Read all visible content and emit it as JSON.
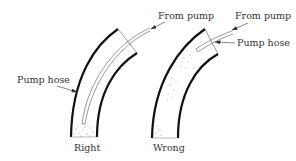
{
  "figure": {
    "panels": [
      {
        "id": "right",
        "caption": "Right",
        "labels": {
          "from_pump": "From pump",
          "pump_hose": "Pump hose"
        }
      },
      {
        "id": "wrong",
        "caption": "Wrong",
        "labels": {
          "from_pump": "From pump",
          "pump_hose": "Pump hose"
        }
      }
    ]
  },
  "colors": {
    "wall": "#111111",
    "hose": "#444444",
    "text": "#333333",
    "sediment": "#777777"
  }
}
